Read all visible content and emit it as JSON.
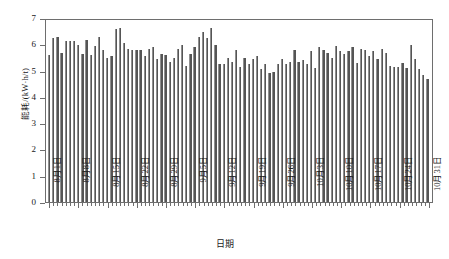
{
  "chart_data": {
    "type": "bar",
    "title": "",
    "xlabel": "日期",
    "ylabel": "能耗/(kW·h/t)",
    "ylim": [
      0,
      7
    ],
    "yticks": [
      0,
      1,
      2,
      3,
      4,
      5,
      6,
      7
    ],
    "grid": false,
    "legend": null,
    "bar_color": "#555555",
    "axis_color": "#6e6e6e",
    "xtick_labels": [
      "8月1日",
      "8月8日",
      "8月15日",
      "8月22日",
      "8月29日",
      "9月5日",
      "9月12日",
      "9月19日",
      "9月26日",
      "10月3日",
      "10月10日",
      "10月17日",
      "10月24日",
      "10月31日"
    ],
    "xtick_indices": [
      0,
      7,
      14,
      21,
      28,
      35,
      42,
      49,
      56,
      63,
      70,
      77,
      84,
      91
    ],
    "categories": [
      "8月1日",
      "8月2日",
      "8月3日",
      "8月4日",
      "8月5日",
      "8月6日",
      "8月7日",
      "8月8日",
      "8月9日",
      "8月10日",
      "8月11日",
      "8月12日",
      "8月13日",
      "8月14日",
      "8月15日",
      "8月16日",
      "8月17日",
      "8月18日",
      "8月19日",
      "8月20日",
      "8月21日",
      "8月22日",
      "8月23日",
      "8月24日",
      "8月25日",
      "8月26日",
      "8月27日",
      "8月28日",
      "8月29日",
      "8月30日",
      "8月31日",
      "9月1日",
      "9月2日",
      "9月3日",
      "9月4日",
      "9月5日",
      "9月6日",
      "9月7日",
      "9月8日",
      "9月9日",
      "9月10日",
      "9月11日",
      "9月12日",
      "9月13日",
      "9月14日",
      "9月15日",
      "9月16日",
      "9月17日",
      "9月18日",
      "9月19日",
      "9月20日",
      "9月21日",
      "9月22日",
      "9月23日",
      "9月24日",
      "9月25日",
      "9月26日",
      "9月27日",
      "9月28日",
      "9月29日",
      "9月30日",
      "10月1日",
      "10月2日",
      "10月3日",
      "10月4日",
      "10月5日",
      "10月6日",
      "10月7日",
      "10月8日",
      "10月9日",
      "10月10日",
      "10月11日",
      "10月12日",
      "10月13日",
      "10月14日",
      "10月15日",
      "10月16日",
      "10月17日",
      "10月18日",
      "10月19日",
      "10月20日",
      "10月21日",
      "10月22日",
      "10月23日",
      "10月24日",
      "10月25日",
      "10月26日",
      "10月27日",
      "10月28日",
      "10月29日",
      "10月30日",
      "10月31日"
    ],
    "values": [
      5.65,
      6.3,
      6.35,
      5.75,
      6.2,
      6.2,
      6.2,
      6.05,
      5.7,
      6.25,
      5.65,
      6.0,
      6.35,
      5.85,
      5.55,
      5.6,
      6.65,
      6.7,
      6.1,
      5.9,
      5.85,
      5.85,
      5.85,
      5.6,
      5.9,
      5.95,
      5.5,
      5.7,
      5.65,
      5.4,
      5.55,
      5.9,
      6.05,
      5.25,
      5.7,
      5.95,
      6.35,
      6.55,
      6.3,
      6.7,
      6.05,
      5.3,
      5.3,
      5.55,
      5.4,
      5.85,
      5.2,
      5.55,
      5.3,
      5.5,
      5.6,
      5.1,
      5.3,
      4.95,
      5.0,
      5.3,
      5.5,
      5.3,
      5.4,
      5.85,
      5.4,
      5.45,
      5.3,
      5.8,
      5.15,
      5.95,
      5.85,
      5.75,
      5.55,
      6.0,
      5.8,
      5.7,
      5.8,
      5.95,
      5.35,
      5.9,
      5.85,
      5.6,
      5.8,
      5.5,
      5.9,
      5.75,
      5.25,
      5.2,
      5.2,
      5.35,
      5.15,
      6.05,
      5.5,
      5.1,
      4.9,
      4.75
    ]
  }
}
